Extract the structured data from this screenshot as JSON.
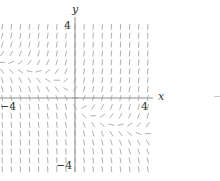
{
  "figure": {
    "type": "slope_field",
    "axes": {
      "x_label": "x",
      "y_label": "y",
      "x_tick_pos": "4",
      "x_tick_neg": "−4",
      "y_tick_pos": "4",
      "y_tick_neg": "−4",
      "xlim": [
        -4,
        4
      ],
      "ylim": [
        -4,
        4
      ]
    },
    "grid": {
      "step": 0.5,
      "segment_length_px": 6
    },
    "colors": {
      "segment": "#9a9a9a",
      "axis": "#8c8c8c",
      "text": "#333333"
    }
  }
}
